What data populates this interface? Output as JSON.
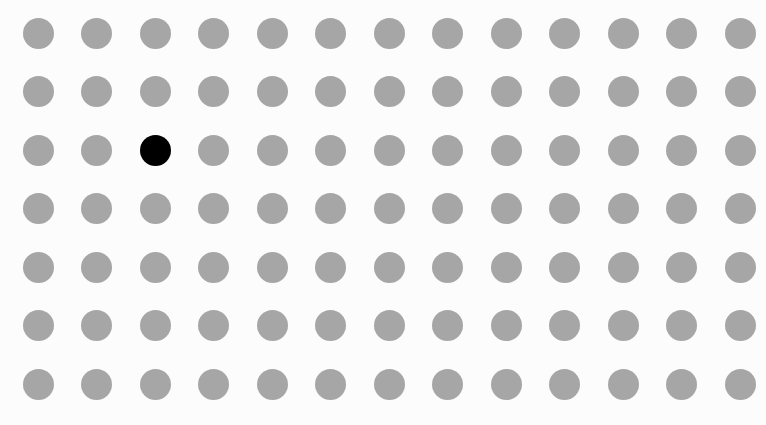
{
  "grid": {
    "columns": 13,
    "rows": 7,
    "origin_x": 38,
    "origin_y": 33,
    "spacing_x": 58.5,
    "spacing_y": 58.5,
    "dot_diameter": 31,
    "dot_color": "#a6a6a6",
    "highlight_color": "#000000",
    "highlighted": [
      {
        "row": 2,
        "col": 2
      }
    ]
  }
}
